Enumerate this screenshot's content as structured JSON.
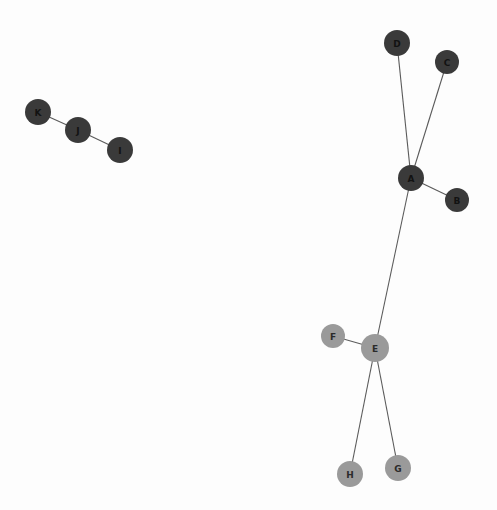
{
  "figure": {
    "background_color": "#fdfdfd",
    "width": 497,
    "height": 510,
    "edge_color": "#5a5a5a",
    "edge_width": 1.1
  },
  "chart_data": {
    "type": "scatter",
    "subtype": "network-graph",
    "title": "",
    "xlabel": "",
    "ylabel": "",
    "grid": false,
    "legend": "none",
    "directed": false,
    "xlim": [
      0,
      497
    ],
    "ylim": [
      0,
      510
    ],
    "node_groups": [
      {
        "name": "dark-group",
        "color": "#3a3a3a",
        "label_color": "#121212",
        "members": [
          "A",
          "B",
          "C",
          "D",
          "I",
          "J",
          "K"
        ]
      },
      {
        "name": "gray-group",
        "color": "#9a9a9a",
        "label_color": "#2b2b2b",
        "members": [
          "E",
          "F",
          "G",
          "H"
        ]
      }
    ],
    "nodes": [
      {
        "id": "A",
        "label": "A",
        "x": 411,
        "y": 178,
        "r": 13,
        "color": "#3a3a3a",
        "label_color": "#121212",
        "group": "dark-group",
        "degree": 4
      },
      {
        "id": "B",
        "label": "B",
        "x": 457,
        "y": 200,
        "r": 12,
        "color": "#3a3a3a",
        "label_color": "#121212",
        "group": "dark-group",
        "degree": 1
      },
      {
        "id": "C",
        "label": "C",
        "x": 447,
        "y": 62,
        "r": 12,
        "color": "#3a3a3a",
        "label_color": "#121212",
        "group": "dark-group",
        "degree": 1
      },
      {
        "id": "D",
        "label": "D",
        "x": 397,
        "y": 43,
        "r": 13,
        "color": "#3a3a3a",
        "label_color": "#121212",
        "group": "dark-group",
        "degree": 1
      },
      {
        "id": "E",
        "label": "E",
        "x": 375,
        "y": 348,
        "r": 14,
        "color": "#9a9a9a",
        "label_color": "#2b2b2b",
        "group": "gray-group",
        "degree": 4
      },
      {
        "id": "F",
        "label": "F",
        "x": 333,
        "y": 336,
        "r": 12,
        "color": "#9a9a9a",
        "label_color": "#2b2b2b",
        "group": "gray-group",
        "degree": 1
      },
      {
        "id": "G",
        "label": "G",
        "x": 398,
        "y": 468,
        "r": 13,
        "color": "#9a9a9a",
        "label_color": "#2b2b2b",
        "group": "gray-group",
        "degree": 1
      },
      {
        "id": "H",
        "label": "H",
        "x": 350,
        "y": 474,
        "r": 13,
        "color": "#9a9a9a",
        "label_color": "#2b2b2b",
        "group": "gray-group",
        "degree": 1
      },
      {
        "id": "I",
        "label": "I",
        "x": 120,
        "y": 150,
        "r": 13,
        "color": "#3a3a3a",
        "label_color": "#121212",
        "group": "dark-group",
        "degree": 1
      },
      {
        "id": "J",
        "label": "J",
        "x": 78,
        "y": 130,
        "r": 13,
        "color": "#3a3a3a",
        "label_color": "#121212",
        "group": "dark-group",
        "degree": 2
      },
      {
        "id": "K",
        "label": "K",
        "x": 38,
        "y": 112,
        "r": 13,
        "color": "#3a3a3a",
        "label_color": "#121212",
        "group": "dark-group",
        "degree": 1
      }
    ],
    "edges": [
      {
        "id": "D-A",
        "source": "D",
        "target": "A",
        "x1": 397,
        "y1": 43,
        "x2": 411,
        "y2": 178
      },
      {
        "id": "C-A",
        "source": "C",
        "target": "A",
        "x1": 447,
        "y1": 62,
        "x2": 411,
        "y2": 178
      },
      {
        "id": "A-B",
        "source": "A",
        "target": "B",
        "x1": 411,
        "y1": 178,
        "x2": 457,
        "y2": 200
      },
      {
        "id": "A-E",
        "source": "A",
        "target": "E",
        "x1": 411,
        "y1": 178,
        "x2": 375,
        "y2": 348
      },
      {
        "id": "F-E",
        "source": "F",
        "target": "E",
        "x1": 333,
        "y1": 336,
        "x2": 375,
        "y2": 348
      },
      {
        "id": "E-H",
        "source": "E",
        "target": "H",
        "x1": 375,
        "y1": 348,
        "x2": 350,
        "y2": 474
      },
      {
        "id": "E-G",
        "source": "E",
        "target": "G",
        "x1": 375,
        "y1": 348,
        "x2": 398,
        "y2": 468
      },
      {
        "id": "K-J",
        "source": "K",
        "target": "J",
        "x1": 38,
        "y1": 112,
        "x2": 78,
        "y2": 130
      },
      {
        "id": "J-I",
        "source": "J",
        "target": "I",
        "x1": 78,
        "y1": 130,
        "x2": 120,
        "y2": 150
      }
    ],
    "components": [
      {
        "name": "component-1",
        "nodes": [
          "A",
          "B",
          "C",
          "D",
          "E",
          "F",
          "G",
          "H"
        ]
      },
      {
        "name": "component-2",
        "nodes": [
          "I",
          "J",
          "K"
        ]
      }
    ]
  }
}
